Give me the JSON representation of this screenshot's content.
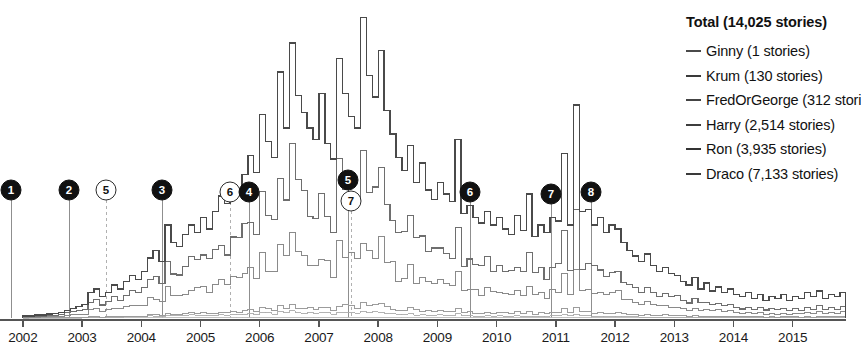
{
  "legend": {
    "title": "Total (14,025 stories)",
    "entries": [
      {
        "label": "Ginny (1 stories)",
        "color": "#4a4a4a"
      },
      {
        "label": "Krum (130 stories)",
        "color": "#3a3a3a"
      },
      {
        "label": "FredOrGeorge (312 stori",
        "color": "#444444"
      },
      {
        "label": "Harry (2,514 stories)",
        "color": "#3d3d3d"
      },
      {
        "label": "Ron (3,935 stories)",
        "color": "#333333"
      },
      {
        "label": "Draco (7,133 stories)",
        "color": "#3a3a3a"
      }
    ]
  },
  "axis": {
    "years": [
      "2002",
      "2003",
      "2004",
      "2005",
      "2006",
      "2007",
      "2008",
      "2009",
      "2010",
      "2011",
      "2012",
      "2013",
      "2014",
      "2015"
    ],
    "baseline_color": "#555555"
  },
  "markers": [
    {
      "id": "1",
      "style": "filled",
      "x": 11,
      "y": 190
    },
    {
      "id": "2",
      "style": "filled",
      "x": 69,
      "y": 190
    },
    {
      "id": "5",
      "style": "outline",
      "x": 106,
      "y": 190
    },
    {
      "id": "3",
      "style": "filled",
      "x": 162,
      "y": 190
    },
    {
      "id": "6",
      "style": "outline",
      "x": 230,
      "y": 192
    },
    {
      "id": "4",
      "style": "filled",
      "x": 249,
      "y": 192
    },
    {
      "id": "5",
      "style": "filled",
      "x": 348,
      "y": 180
    },
    {
      "id": "7",
      "style": "outline",
      "x": 351,
      "y": 201
    },
    {
      "id": "6",
      "style": "filled",
      "x": 470,
      "y": 192
    },
    {
      "id": "7",
      "style": "filled",
      "x": 551,
      "y": 194
    },
    {
      "id": "8",
      "style": "filled",
      "x": 591,
      "y": 192
    }
  ],
  "chart_data": {
    "type": "area",
    "title": "Total (14,025 stories)",
    "xlabel": "",
    "ylabel": "",
    "grid": false,
    "legend_position": "right",
    "xlim": [
      2001.8,
      2015.9
    ],
    "x_tick_labels": [
      "2002",
      "2003",
      "2004",
      "2005",
      "2006",
      "2007",
      "2008",
      "2009",
      "2010",
      "2011",
      "2012",
      "2013",
      "2014",
      "2015"
    ],
    "stacked": true,
    "step": true,
    "note": "Stacked step area chart of Hermione-pairing fanfiction stories per month, 2002-2015. Series ordered bottom-to-top: Ginny, Krum, FredOrGeorge, Harry, Ron, Draco.",
    "series": [
      {
        "name": "Ginny",
        "total": 1
      },
      {
        "name": "Krum",
        "total": 130
      },
      {
        "name": "FredOrGeorge",
        "total": 312
      },
      {
        "name": "Harry",
        "total": 2514
      },
      {
        "name": "Ron",
        "total": 3935
      },
      {
        "name": "Draco",
        "total": 7133
      }
    ],
    "total": 14025,
    "x": [
      2002.0,
      2002.1,
      2002.2,
      2002.3,
      2002.4,
      2002.5,
      2002.6,
      2002.7,
      2002.8,
      2002.9,
      2003.0,
      2003.1,
      2003.2,
      2003.3,
      2003.4,
      2003.5,
      2003.6,
      2003.7,
      2003.8,
      2003.9,
      2004.0,
      2004.1,
      2004.2,
      2004.3,
      2004.4,
      2004.5,
      2004.6,
      2004.7,
      2004.8,
      2004.9,
      2005.0,
      2005.1,
      2005.2,
      2005.3,
      2005.4,
      2005.5,
      2005.6,
      2005.7,
      2005.8,
      2005.9,
      2006.0,
      2006.1,
      2006.2,
      2006.3,
      2006.4,
      2006.5,
      2006.6,
      2006.7,
      2006.8,
      2006.9,
      2007.0,
      2007.1,
      2007.2,
      2007.3,
      2007.4,
      2007.5,
      2007.6,
      2007.7,
      2007.8,
      2007.9,
      2008.0,
      2008.1,
      2008.2,
      2008.3,
      2008.4,
      2008.5,
      2008.6,
      2008.7,
      2008.8,
      2008.9,
      2009.0,
      2009.1,
      2009.2,
      2009.3,
      2009.4,
      2009.5,
      2009.6,
      2009.7,
      2009.8,
      2009.9,
      2010.0,
      2010.1,
      2010.2,
      2010.3,
      2010.4,
      2010.5,
      2010.6,
      2010.7,
      2010.8,
      2010.9,
      2011.0,
      2011.1,
      2011.2,
      2011.3,
      2011.4,
      2011.5,
      2011.6,
      2011.7,
      2011.8,
      2011.9,
      2012.0,
      2012.1,
      2012.2,
      2012.3,
      2012.4,
      2012.5,
      2012.6,
      2012.7,
      2012.8,
      2012.9,
      2013.0,
      2013.1,
      2013.2,
      2013.3,
      2013.4,
      2013.5,
      2013.6,
      2013.7,
      2013.8,
      2013.9,
      2014.0,
      2014.1,
      2014.2,
      2014.3,
      2014.4,
      2014.5,
      2014.6,
      2014.7,
      2014.8,
      2014.9,
      2015.0,
      2015.1,
      2015.2,
      2015.3,
      2015.4,
      2015.5,
      2015.6,
      2015.7,
      2015.8,
      2015.9
    ],
    "stack_totals": [
      2,
      2,
      3,
      3,
      4,
      5,
      6,
      8,
      10,
      12,
      14,
      26,
      30,
      22,
      26,
      34,
      30,
      38,
      44,
      40,
      48,
      62,
      70,
      58,
      96,
      78,
      74,
      86,
      96,
      88,
      104,
      92,
      110,
      126,
      118,
      138,
      132,
      148,
      168,
      150,
      210,
      182,
      166,
      254,
      196,
      284,
      230,
      212,
      196,
      184,
      232,
      180,
      164,
      268,
      232,
      208,
      196,
      310,
      250,
      228,
      276,
      214,
      190,
      166,
      152,
      178,
      140,
      160,
      132,
      122,
      140,
      128,
      120,
      184,
      108,
      116,
      104,
      98,
      110,
      96,
      104,
      92,
      86,
      106,
      90,
      128,
      84,
      96,
      88,
      104,
      100,
      170,
      96,
      220,
      110,
      112,
      96,
      104,
      88,
      96,
      92,
      78,
      70,
      64,
      58,
      66,
      54,
      48,
      52,
      46,
      44,
      38,
      34,
      42,
      30,
      36,
      28,
      32,
      26,
      30,
      24,
      22,
      26,
      20,
      24,
      18,
      22,
      20,
      24,
      18,
      22,
      20,
      26,
      22,
      28,
      20,
      24,
      22,
      26,
      24
    ]
  }
}
